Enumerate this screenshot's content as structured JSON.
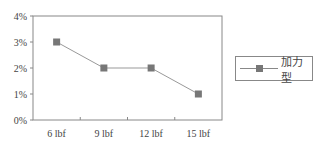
{
  "chart_data": {
    "type": "line",
    "title": "",
    "xlabel": "",
    "ylabel": "",
    "categories": [
      "6 lbf",
      "9 lbf",
      "12 lbf",
      "15 lbf"
    ],
    "series": [
      {
        "name": "加力型",
        "values": [
          3,
          2,
          2,
          1
        ],
        "unit": "%"
      }
    ],
    "yticks": [
      "0%",
      "1%",
      "2%",
      "3%",
      "4%"
    ],
    "ylim": [
      0,
      4
    ],
    "grid": false,
    "legend_position": "right",
    "colors": {
      "line": "#999999",
      "marker": "#777777",
      "axis": "#888888"
    }
  },
  "legend": {
    "label": "加力型"
  }
}
